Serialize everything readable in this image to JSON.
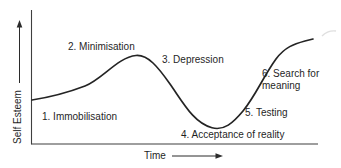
{
  "figure": {
    "type": "curve-diagram",
    "y_axis": {
      "label": "Self Esteem"
    },
    "x_axis": {
      "label": "Time"
    },
    "stages": [
      {
        "label": "1. Immobilisation"
      },
      {
        "label": "2. Minimisation"
      },
      {
        "label": "3. Depression"
      },
      {
        "label": "4. Acceptance of reality"
      },
      {
        "label": "5. Testing"
      },
      {
        "label": "6. Search for meaning"
      }
    ],
    "curve_description": "Self esteem starts mid-level, rises to a peak at minimisation, falls through depression to a trough at acceptance of reality, then rises through testing to its highest level at search for meaning",
    "colors": {
      "line": "#242424",
      "axis": "#3f3f3f",
      "text": "#1f1f1f",
      "background": "#ffffff"
    }
  }
}
